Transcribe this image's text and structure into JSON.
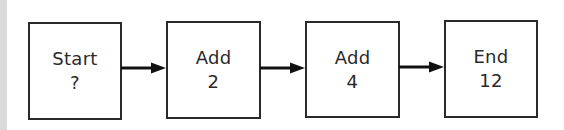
{
  "diagram": {
    "type": "flowchart",
    "direction": "left-to-right",
    "nodes": [
      {
        "id": "start",
        "title": "Start",
        "value": "?"
      },
      {
        "id": "add2",
        "title": "Add",
        "value": "2"
      },
      {
        "id": "add4",
        "title": "Add",
        "value": "4"
      },
      {
        "id": "end",
        "title": "End",
        "value": "12"
      }
    ],
    "edges": [
      {
        "from": "start",
        "to": "add2"
      },
      {
        "from": "add2",
        "to": "add4"
      },
      {
        "from": "add4",
        "to": "end"
      }
    ]
  },
  "colors": {
    "stroke": "#2a2a2a",
    "background": "#ffffff",
    "left_strip": "#dadada"
  }
}
